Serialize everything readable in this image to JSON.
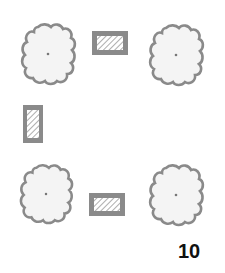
{
  "diagram": {
    "colors": {
      "outline": "#8a8a8a",
      "tree_fill": "#f4f4f4",
      "hatch": "#9a9a9a",
      "background": "#ffffff",
      "text": "#111111"
    },
    "trees": [
      {
        "id": "tree-top-left",
        "cx": 48,
        "cy": 54,
        "rx": 25,
        "ry": 29
      },
      {
        "id": "tree-top-right",
        "cx": 176,
        "cy": 55,
        "rx": 25,
        "ry": 29
      },
      {
        "id": "tree-bottom-left",
        "cx": 46,
        "cy": 194,
        "rx": 24,
        "ry": 28
      },
      {
        "id": "tree-bottom-right",
        "cx": 176,
        "cy": 195,
        "rx": 25,
        "ry": 29
      }
    ],
    "planters": [
      {
        "id": "planter-top",
        "x": 92,
        "y": 31,
        "w": 36,
        "h": 24,
        "orientation": "horizontal"
      },
      {
        "id": "planter-left",
        "x": 23,
        "y": 105,
        "w": 20,
        "h": 38,
        "orientation": "vertical"
      },
      {
        "id": "planter-bottom",
        "x": 89,
        "y": 193,
        "w": 36,
        "h": 23,
        "orientation": "horizontal"
      }
    ]
  },
  "page": {
    "number": "10"
  }
}
